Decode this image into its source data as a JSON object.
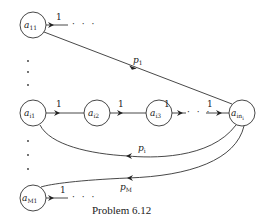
{
  "caption": "Problem 6.12",
  "nodes": {
    "a11": {
      "base": "a",
      "sub": "11"
    },
    "ai1": {
      "base": "a",
      "sub": "i1"
    },
    "ai2": {
      "base": "a",
      "sub": "i2"
    },
    "ai3": {
      "base": "a",
      "sub": "i3"
    },
    "ain": {
      "base": "a",
      "sub": "in",
      "subsub": "i"
    },
    "aM1": {
      "base": "a",
      "sub": "M1"
    }
  },
  "edges": {
    "a11_out": "1",
    "ai1_ai2": "1",
    "ai2_ai3": "1",
    "ai3_out": "1",
    "into_ain": "1",
    "aM1_out": "1"
  },
  "ellipsis": "· · ·",
  "vertical_dots": "·",
  "probabilities": {
    "p1": {
      "base": "p",
      "sub": "1"
    },
    "pi": {
      "base": "p",
      "sub": "i"
    },
    "pM": {
      "base": "p",
      "sub": "M"
    }
  }
}
